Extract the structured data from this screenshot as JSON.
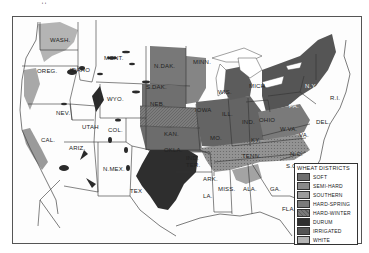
{
  "map": {
    "title": "Wheat Districts of the United States",
    "top_mark": "ˈˈ",
    "states": [
      {
        "id": "wash",
        "label": "WASH."
      },
      {
        "id": "oreg",
        "label": "OREG."
      },
      {
        "id": "idaho",
        "label": "IDAHO"
      },
      {
        "id": "mont",
        "label": "MONT."
      },
      {
        "id": "wyo",
        "label": "WYO."
      },
      {
        "id": "nev",
        "label": "NEV."
      },
      {
        "id": "utah",
        "label": "UTAH"
      },
      {
        "id": "col",
        "label": "COL."
      },
      {
        "id": "cal",
        "label": "CAL."
      },
      {
        "id": "ariz",
        "label": "ARIZ."
      },
      {
        "id": "nmex",
        "label": "N.MEX."
      },
      {
        "id": "tex",
        "label": "TEX"
      },
      {
        "id": "ndak",
        "label": "N.DAK."
      },
      {
        "id": "sdak",
        "label": "S.DAK."
      },
      {
        "id": "neb",
        "label": "NEB."
      },
      {
        "id": "kan",
        "label": "KAN."
      },
      {
        "id": "okla",
        "label": "OKLA."
      },
      {
        "id": "indter",
        "label": "IND. TER."
      },
      {
        "id": "minn",
        "label": "MINN."
      },
      {
        "id": "iowa",
        "label": "IOWA"
      },
      {
        "id": "mo",
        "label": "MO."
      },
      {
        "id": "ark",
        "label": "ARK."
      },
      {
        "id": "la",
        "label": "LA."
      },
      {
        "id": "wis",
        "label": "WIS."
      },
      {
        "id": "ill",
        "label": "ILL."
      },
      {
        "id": "miss",
        "label": "MISS."
      },
      {
        "id": "mich",
        "label": "MICH."
      },
      {
        "id": "ind",
        "label": "IND."
      },
      {
        "id": "ohio",
        "label": "OHIO"
      },
      {
        "id": "ky",
        "label": "KY."
      },
      {
        "id": "tenn",
        "label": "TENN."
      },
      {
        "id": "ala",
        "label": "ALA."
      },
      {
        "id": "ga",
        "label": "GA."
      },
      {
        "id": "fla",
        "label": "FLA."
      },
      {
        "id": "pa",
        "label": "PA."
      },
      {
        "id": "ny",
        "label": "N.Y."
      },
      {
        "id": "wva",
        "label": "W.VA."
      },
      {
        "id": "va",
        "label": "VA."
      },
      {
        "id": "nc",
        "label": "N.C."
      },
      {
        "id": "sc",
        "label": "S.C."
      },
      {
        "id": "del",
        "label": "DEL."
      },
      {
        "id": "ri",
        "label": "R.I."
      }
    ]
  },
  "legend": {
    "title": "WHEAT DISTRICTS",
    "items": [
      {
        "label": "SOFT",
        "color": "#6e6e6e"
      },
      {
        "label": "SEMI-HARD",
        "color": "#8a8a8a"
      },
      {
        "label": "SOUTHERN",
        "color": "#9c9c9c"
      },
      {
        "label": "HARD-SPRING",
        "color": "#7a7a7a"
      },
      {
        "label": "HARD-WINTER",
        "color": "#5f5f5f"
      },
      {
        "label": "DURUM",
        "color": "#2f2f2f"
      },
      {
        "label": "IRRIGATED",
        "color": "#555555"
      },
      {
        "label": "WHITE",
        "color": "#b4b4b4"
      }
    ]
  }
}
